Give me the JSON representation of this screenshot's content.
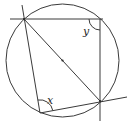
{
  "diagram": {
    "type": "circle-geometry",
    "circle": {
      "cx": 62.5,
      "cy": 60.5,
      "r": 56.5
    },
    "centre": {
      "x": 62.5,
      "y": 60.5
    },
    "points": {
      "A": {
        "x": 24,
        "y": 19
      },
      "B": {
        "x": 100,
        "y": 101
      },
      "C": {
        "x": 40,
        "y": 113
      }
    },
    "lines": {
      "horizontal": {
        "x1": 10,
        "y1": 19,
        "x2": 103,
        "y2": 19
      },
      "vertical": {
        "x1": 100,
        "y1": 19,
        "x2": 100,
        "y2": 121
      },
      "ac_extended": {
        "x1": 22,
        "y1": 5,
        "x2": 40,
        "y2": 113
      },
      "cb_extended": {
        "x1": 40,
        "y1": 113,
        "x2": 127,
        "y2": 97
      },
      "diameter_ab": {
        "x1": 24,
        "y1": 19,
        "x2": 100,
        "y2": 101
      }
    },
    "angles": {
      "x": {
        "label": "x",
        "at": "C"
      },
      "y": {
        "label": "y",
        "at": "top-right corner"
      }
    }
  }
}
